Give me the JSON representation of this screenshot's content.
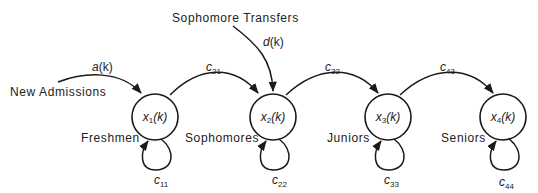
{
  "diagram": {
    "type": "state-transition",
    "colors": {
      "stroke": "#1a1a1a",
      "text": "#222222",
      "background": "#ffffff"
    },
    "nodes": [
      {
        "id": "x1",
        "var": "x",
        "sub": "1",
        "arg": "(k)",
        "label": "Freshmen"
      },
      {
        "id": "x2",
        "var": "x",
        "sub": "2",
        "arg": "(k)",
        "label": "Sophomores"
      },
      {
        "id": "x3",
        "var": "x",
        "sub": "3",
        "arg": "(k)",
        "label": "Juniors"
      },
      {
        "id": "x4",
        "var": "x",
        "sub": "4",
        "arg": "(k)",
        "label": "Seniors"
      }
    ],
    "inputs": [
      {
        "source_label": "New Admissions",
        "symbol": "a",
        "arg": "(k)",
        "target": "x1"
      },
      {
        "source_label": "Sophomore Transfers",
        "symbol": "d",
        "arg": "(k)",
        "target": "x2"
      }
    ],
    "transitions": [
      {
        "from": "x1",
        "to": "x2",
        "var": "c",
        "sub": "21"
      },
      {
        "from": "x2",
        "to": "x3",
        "var": "c",
        "sub": "32"
      },
      {
        "from": "x3",
        "to": "x4",
        "var": "c",
        "sub": "43"
      }
    ],
    "self_loops": [
      {
        "node": "x1",
        "var": "c",
        "sub": "11"
      },
      {
        "node": "x2",
        "var": "c",
        "sub": "22"
      },
      {
        "node": "x3",
        "var": "c",
        "sub": "33"
      },
      {
        "node": "x4",
        "var": "c",
        "sub": "44"
      }
    ]
  }
}
